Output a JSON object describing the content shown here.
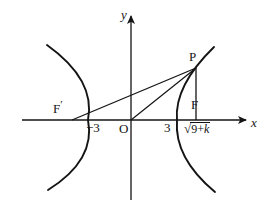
{
  "figure": {
    "type": "geometry-diagram",
    "background_color": "#ffffff",
    "stroke_color": "#141414"
  },
  "axes": {
    "x_label": "x",
    "y_label": "y",
    "origin_label": "O",
    "x_axis_y_px": 120,
    "y_axis_x_px": 131,
    "x_axis_from_px": 22,
    "x_axis_to_px": 248,
    "y_axis_from_px": 200,
    "y_axis_to_px": 14
  },
  "points": [
    {
      "name": "P",
      "label": "P",
      "x_px": 196,
      "y_px": 68
    },
    {
      "name": "F",
      "label": "F",
      "x_px": 196,
      "y_px": 120
    },
    {
      "name": "F-prime",
      "label": "F",
      "prime": "′",
      "x_px": 72,
      "y_px": 120
    },
    {
      "name": "O",
      "label": "O",
      "x_px": 131,
      "y_px": 120
    }
  ],
  "tick_labels": {
    "left_vertex": "−3",
    "right_vertex": "3",
    "focus_radical_sign": "√",
    "focus_radical_inner_a": "9+",
    "focus_radical_inner_k": "k"
  },
  "curves": {
    "left_branch_vertex_px": [
      88,
      120
    ],
    "right_branch_vertex_px": [
      177,
      120
    ],
    "left_branch_path": "M 47 45 Q 96 80 88 120 Q 96 160 48 190",
    "right_branch_path": "M 214 47 Q 174 86 177 120 Q 174 158 215 192"
  },
  "segments": [
    {
      "name": "segment-FprimeP",
      "from": "F-prime",
      "to": "P"
    },
    {
      "name": "segment-OP",
      "from": "O",
      "to": "P"
    },
    {
      "name": "segment-FP",
      "from": "F",
      "to": "P"
    }
  ]
}
